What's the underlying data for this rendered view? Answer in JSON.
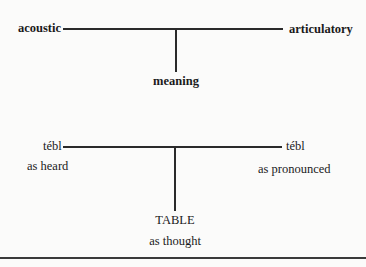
{
  "diagram": {
    "top": {
      "left_label": "acoustic",
      "right_label": "articulatory",
      "bottom_label": "meaning"
    },
    "bottom": {
      "left_label": "tébl",
      "left_caption": "as heard",
      "right_label": "tébl",
      "right_caption": "as pronounced",
      "bottom_label": "TABLE",
      "bottom_caption": "as thought"
    }
  },
  "colors": {
    "background": "#fbfbfa",
    "ink": "#1a1a1a",
    "line": "#2a2a2a"
  }
}
